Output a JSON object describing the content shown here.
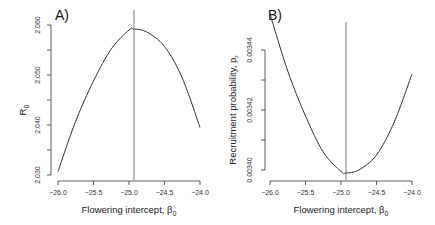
{
  "chart_data": [
    {
      "type": "line",
      "panel_label": "A)",
      "title": "",
      "xlabel": "Flowering intercept, β",
      "xlabel_sub": "0",
      "ylabel": "R",
      "ylabel_sub": "0",
      "xlim": [
        -26.0,
        -24.0
      ],
      "ylim": [
        2.03,
        2.06
      ],
      "x_ticks": [
        -26.0,
        -25.5,
        -25.0,
        -24.5,
        -24.0
      ],
      "x_tick_labels": [
        "−26.0",
        "−25.5",
        "−25.0",
        "−24.5",
        "−24.0"
      ],
      "y_ticks": [
        2.03,
        2.04,
        2.05,
        2.06
      ],
      "y_tick_labels": [
        "2.030",
        "2.040",
        "2.050",
        "2.060"
      ],
      "y_minor_ticks": [
        2.035,
        2.045,
        2.055
      ],
      "grid": false,
      "series": [
        {
          "name": "R0",
          "x": [
            -26.0,
            -25.75,
            -25.5,
            -25.25,
            -25.0,
            -24.93,
            -24.75,
            -24.5,
            -24.25,
            -24.0
          ],
          "y": [
            2.0307,
            2.0408,
            2.0488,
            2.0552,
            2.059,
            2.0592,
            2.0586,
            2.0557,
            2.0494,
            2.0395
          ]
        }
      ],
      "vertical_line_x": -24.93,
      "peak": {
        "x": -24.93,
        "y": 2.0592
      }
    },
    {
      "type": "line",
      "panel_label": "B)",
      "title": "",
      "xlabel": "Flowering intercept, β",
      "xlabel_sub": "0",
      "ylabel": "Recruitment probability, p",
      "ylabel_sub": "r",
      "xlim": [
        -26.0,
        -24.0
      ],
      "ylim": [
        0.0034,
        0.00345
      ],
      "x_ticks": [
        -26.0,
        -25.5,
        -25.0,
        -24.5,
        -24.0
      ],
      "x_tick_labels": [
        "−26.0",
        "−25.5",
        "−25.0",
        "−24.5",
        "−24.0"
      ],
      "y_ticks": [
        0.0034,
        0.00342,
        0.00344
      ],
      "y_tick_labels": [
        "0.00340",
        "0.00342",
        "0.00344"
      ],
      "y_minor_ticks": [
        0.00341,
        0.00343
      ],
      "grid": false,
      "series": [
        {
          "name": "p_r",
          "x": [
            -26.0,
            -25.75,
            -25.5,
            -25.25,
            -25.0,
            -24.93,
            -24.75,
            -24.5,
            -24.25,
            -24.0
          ],
          "y": [
            0.003452,
            0.003433,
            0.003418,
            0.003406,
            0.0033995,
            0.003399,
            0.0034,
            0.003405,
            0.003416,
            0.003432
          ]
        }
      ],
      "vertical_line_x": -24.93,
      "minimum": {
        "x": -24.93,
        "y": 0.003399
      }
    }
  ]
}
